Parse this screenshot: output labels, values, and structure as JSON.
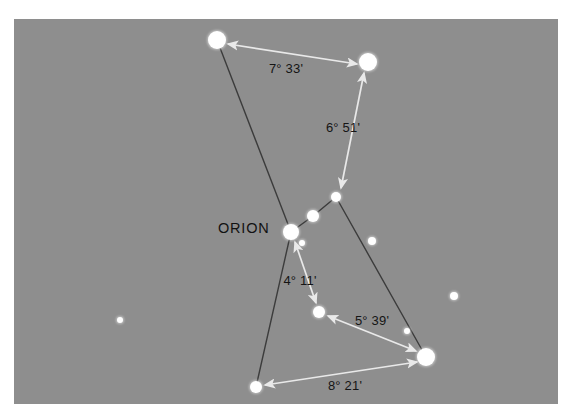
{
  "figure": {
    "title_label": "ORION",
    "canvas": {
      "x": 14,
      "y": 19,
      "width": 544,
      "height": 385,
      "fill": "#8e8e8e",
      "page_background": "#ffffff"
    },
    "palette": {
      "sky": "#8e8e8e",
      "star": "#ffffff",
      "constellation_line": "#3c3c3c",
      "measure_arrow": "#e9e9e9",
      "text": "#151515"
    }
  },
  "stars": [
    {
      "name": "betelgeuse",
      "x": 217,
      "y": 40,
      "r": 9.0,
      "magnitude_class": "bright"
    },
    {
      "name": "bellatrix",
      "x": 368,
      "y": 62,
      "r": 9.0,
      "magnitude_class": "bright"
    },
    {
      "name": "alnitak",
      "x": 291,
      "y": 232,
      "r": 8.0,
      "magnitude_class": "bright"
    },
    {
      "name": "alnilam",
      "x": 313,
      "y": 216,
      "r": 6.0,
      "magnitude_class": "medium"
    },
    {
      "name": "mintaka",
      "x": 336,
      "y": 197,
      "r": 5.0,
      "magnitude_class": "medium"
    },
    {
      "name": "saiph",
      "x": 319,
      "y": 312,
      "r": 6.0,
      "magnitude_class": "medium"
    },
    {
      "name": "rigel",
      "x": 426,
      "y": 357,
      "r": 9.0,
      "magnitude_class": "bright"
    },
    {
      "name": "lower-left-star",
      "x": 256,
      "y": 387,
      "r": 6.0,
      "magnitude_class": "medium"
    },
    {
      "name": "field-star-near-alnitak",
      "x": 302,
      "y": 243,
      "r": 3.0,
      "magnitude_class": "faint"
    },
    {
      "name": "field-star-center-right",
      "x": 372,
      "y": 241,
      "r": 4.0,
      "magnitude_class": "faint"
    },
    {
      "name": "field-star-above-rigel",
      "x": 407,
      "y": 331,
      "r": 3.0,
      "magnitude_class": "faint"
    },
    {
      "name": "field-star-right-edge",
      "x": 454,
      "y": 296,
      "r": 4.0,
      "magnitude_class": "faint"
    },
    {
      "name": "field-star-left",
      "x": 120,
      "y": 320,
      "r": 3.0,
      "magnitude_class": "faint"
    }
  ],
  "constellation_lines": [
    {
      "name": "betelgeuse-to-alnitak",
      "x1": 217,
      "y1": 40,
      "x2": 291,
      "y2": 232
    },
    {
      "name": "alnitak-to-alnilam",
      "x1": 291,
      "y1": 232,
      "x2": 313,
      "y2": 216
    },
    {
      "name": "alnilam-to-mintaka",
      "x1": 313,
      "y1": 216,
      "x2": 336,
      "y2": 197
    },
    {
      "name": "mintaka-to-rigel",
      "x1": 336,
      "y1": 197,
      "x2": 426,
      "y2": 357
    },
    {
      "name": "alnitak-to-lower-left-star",
      "x1": 291,
      "y1": 232,
      "x2": 256,
      "y2": 387
    }
  ],
  "measurements": [
    {
      "name": "betelgeuse-bellatrix",
      "label": "7° 33'",
      "x1": 228,
      "y1": 44,
      "x2": 357,
      "y2": 64,
      "label_x": 286,
      "label_y": 73
    },
    {
      "name": "bellatrix-mintaka",
      "label": "6° 51'",
      "x1": 364,
      "y1": 73,
      "x2": 341,
      "y2": 188,
      "label_x": 343,
      "label_y": 132
    },
    {
      "name": "alnitak-saiph",
      "label": "4° 11'",
      "x1": 295,
      "y1": 242,
      "x2": 316,
      "y2": 303,
      "label_x": 300,
      "label_y": 285
    },
    {
      "name": "saiph-rigel",
      "label": "5° 39'",
      "x1": 328,
      "y1": 316,
      "x2": 416,
      "y2": 351,
      "label_x": 372,
      "label_y": 325
    },
    {
      "name": "lower-left-rigel",
      "label": "8° 21'",
      "x1": 265,
      "y1": 385,
      "x2": 417,
      "y2": 362,
      "label_x": 345,
      "label_y": 390
    }
  ],
  "annotations": [
    {
      "name": "orion-name-label",
      "text": "ORION",
      "x": 218,
      "y": 233
    }
  ]
}
